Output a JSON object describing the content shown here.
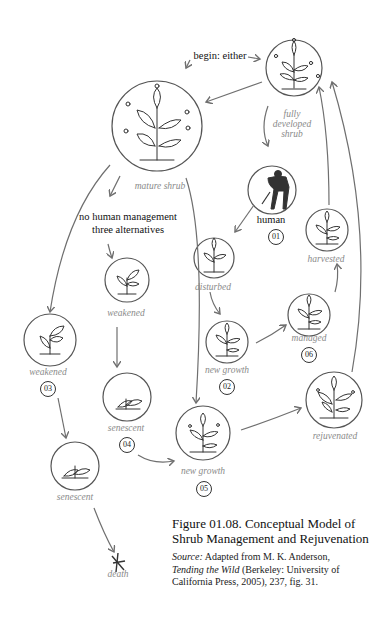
{
  "diagram": {
    "begin_label": "begin: either",
    "nodes": {
      "fully_developed": {
        "label": "fully\ndeveloped\nshrub"
      },
      "mature": {
        "label": "mature shrub"
      },
      "human": {
        "label": "human",
        "number": "01"
      },
      "no_human": {
        "label_line1": "no human management",
        "label_line2": "three alternatives"
      },
      "weakened_mid": {
        "label": "weakened"
      },
      "weakened_left": {
        "label": "weakened",
        "number": "03"
      },
      "senescent_mid": {
        "label": "senescent",
        "number": "04"
      },
      "senescent_left": {
        "label": "senescent"
      },
      "death": {
        "label": "death",
        "symbol": "✕"
      },
      "disturbed": {
        "label": "disturbed"
      },
      "new_growth_02": {
        "label": "new growth",
        "number": "02"
      },
      "managed": {
        "label": "managed",
        "number": "06"
      },
      "harvested": {
        "label": "harvested"
      },
      "new_growth_05": {
        "label": "new growth",
        "number": "05"
      },
      "rejuvenated": {
        "label": "rejuvenated"
      }
    },
    "colors": {
      "stroke": "#555555",
      "label": "#8a8a8a",
      "arrow": "#6f6f6f"
    }
  },
  "caption": {
    "title_line1": "Figure 01.08. Conceptual Model of",
    "title_line2": "Shrub Management and Rejuvenation",
    "source_label": "Source:",
    "source_line1_rest": " Adapted from M. K. Anderson,",
    "book_title": "Tending the Wild",
    "source_line2_rest": " (Berkeley: University of",
    "source_line3": "California Press, 2005), 237, fig. 31."
  }
}
